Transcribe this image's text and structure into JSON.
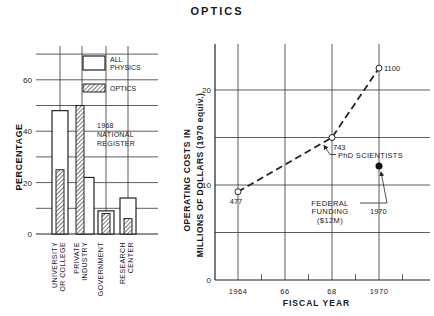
{
  "title": "OPTICS",
  "chart_data": [
    {
      "type": "bar",
      "title": "1968 NATIONAL REGISTER",
      "ylabel": "PERCENTAGE",
      "xlabel": "",
      "ylim": [
        0,
        70
      ],
      "yticks": [
        0,
        20,
        40,
        60
      ],
      "categories": [
        "UNIVERSITY OR COLLEGE",
        "PRIVATE INDUSTRY",
        "GOVERNMENT",
        "RESEARCH CENTER"
      ],
      "series": [
        {
          "name": "ALL PHYSICS",
          "values": [
            48,
            22,
            9,
            14
          ],
          "style": "open"
        },
        {
          "name": "OPTICS",
          "values": [
            25,
            50,
            8,
            6
          ],
          "style": "hatched"
        }
      ],
      "legend": [
        "ALL PHYSICS",
        "OPTICS"
      ],
      "annotation": "1968 NATIONAL REGISTER",
      "grid": true
    },
    {
      "type": "line",
      "title": "",
      "ylabel": "OPERATING COSTS IN MILLIONS OF DOLLARS (1970 equiv.)",
      "xlabel": "FISCAL YEAR",
      "xlim": [
        1963,
        1971.2
      ],
      "ylim": [
        0,
        25
      ],
      "xticks": [
        1964,
        1966,
        1968,
        1970
      ],
      "xtick_labels": [
        "1964",
        "66",
        "68",
        "1970"
      ],
      "yticks": [
        0,
        10,
        20
      ],
      "series": [
        {
          "name": "PhD SCIENTISTS",
          "x": [
            1964,
            1968,
            1970
          ],
          "y": [
            9.3,
            15.0,
            22.3
          ],
          "point_labels": [
            "477",
            "743",
            "1100"
          ],
          "style": "dashed-open-markers"
        },
        {
          "name": "FEDERAL FUNDING ($12M)",
          "x": [
            1970
          ],
          "y": [
            12
          ],
          "point_labels": [
            "1970"
          ],
          "style": "filled-marker"
        }
      ],
      "annotations": [
        "PhD SCIENTISTS",
        "FEDERAL FUNDING ($12M)",
        "1970"
      ],
      "grid": true
    }
  ]
}
